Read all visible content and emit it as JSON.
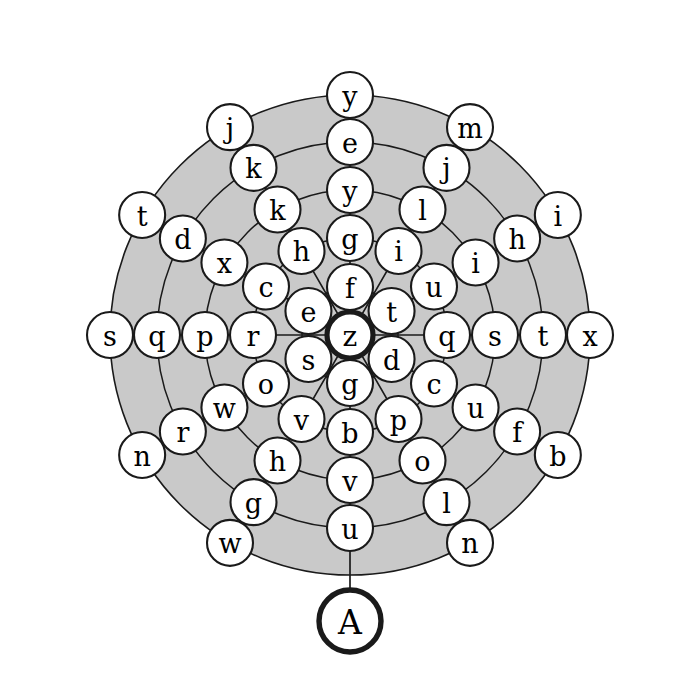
{
  "figure": {
    "name": "radial-letter-tree",
    "background_color": "#ffffff",
    "ring_fill_color": "#c9c9c9",
    "node_fill_color": "#ffffff",
    "stroke_color": "#1a1a1a"
  },
  "geometry": {
    "center_x": 350,
    "center_y": 335,
    "ring_radii": [
      48,
      97,
      145,
      193,
      240
    ],
    "node_radius": 23,
    "goal_node_radius": 31,
    "spoke_count": 12,
    "spoke_step_degrees": 30,
    "goal_radius": 286
  },
  "chart_data": {
    "type": "tree",
    "title": "",
    "root": {
      "label": "z",
      "emphasis": "bold"
    },
    "goal": {
      "label": "A",
      "emphasis": "bold",
      "angle_degrees": 90
    },
    "spokes": [
      {
        "angle_degrees": 270,
        "direction": "north",
        "labels": [
          "f",
          "g",
          "y",
          "e",
          "y"
        ]
      },
      {
        "angle_degrees": 300,
        "direction": "north-northeast",
        "labels": [
          "i",
          "l",
          "j",
          "m"
        ]
      },
      {
        "angle_degrees": 330,
        "direction": "northeast",
        "labels": [
          "t",
          "u",
          "i",
          "h",
          "i"
        ]
      },
      {
        "angle_degrees": 0,
        "direction": "east",
        "labels": [
          "q",
          "s",
          "t",
          "x"
        ]
      },
      {
        "angle_degrees": 30,
        "direction": "southeast",
        "labels": [
          "d",
          "c",
          "u",
          "f",
          "b"
        ]
      },
      {
        "angle_degrees": 60,
        "direction": "south-southeast",
        "labels": [
          "p",
          "o",
          "l",
          "n"
        ]
      },
      {
        "angle_degrees": 90,
        "direction": "south",
        "labels": [
          "g",
          "b",
          "v",
          "u"
        ]
      },
      {
        "angle_degrees": 120,
        "direction": "south-southwest",
        "labels": [
          "v",
          "h",
          "g",
          "w"
        ]
      },
      {
        "angle_degrees": 150,
        "direction": "southwest",
        "labels": [
          "s",
          "o",
          "w",
          "r",
          "n"
        ]
      },
      {
        "angle_degrees": 180,
        "direction": "west",
        "labels": [
          "r",
          "p",
          "q",
          "s"
        ]
      },
      {
        "angle_degrees": 210,
        "direction": "northwest",
        "labels": [
          "e",
          "c",
          "x",
          "d",
          "t"
        ]
      },
      {
        "angle_degrees": 240,
        "direction": "north-northwest",
        "labels": [
          "h",
          "k",
          "k",
          "j"
        ]
      }
    ],
    "nodes": [
      {
        "label": "z",
        "ring": 0,
        "angle": 0,
        "kind": "root"
      },
      {
        "label": "f",
        "ring": 1,
        "angle": 270
      },
      {
        "label": "t",
        "ring": 1,
        "angle": 330
      },
      {
        "label": "d",
        "ring": 1,
        "angle": 30
      },
      {
        "label": "g",
        "ring": 1,
        "angle": 90
      },
      {
        "label": "s",
        "ring": 1,
        "angle": 150
      },
      {
        "label": "e",
        "ring": 1,
        "angle": 210
      },
      {
        "label": "g",
        "ring": 2,
        "angle": 270
      },
      {
        "label": "i",
        "ring": 2,
        "angle": 300
      },
      {
        "label": "u",
        "ring": 2,
        "angle": 330
      },
      {
        "label": "q",
        "ring": 2,
        "angle": 0
      },
      {
        "label": "c",
        "ring": 2,
        "angle": 30
      },
      {
        "label": "p",
        "ring": 2,
        "angle": 60
      },
      {
        "label": "b",
        "ring": 2,
        "angle": 90
      },
      {
        "label": "v",
        "ring": 2,
        "angle": 120
      },
      {
        "label": "o",
        "ring": 2,
        "angle": 150
      },
      {
        "label": "r",
        "ring": 2,
        "angle": 180
      },
      {
        "label": "c",
        "ring": 2,
        "angle": 210
      },
      {
        "label": "h",
        "ring": 2,
        "angle": 240
      },
      {
        "label": "y",
        "ring": 3,
        "angle": 270
      },
      {
        "label": "l",
        "ring": 3,
        "angle": 300
      },
      {
        "label": "i",
        "ring": 3,
        "angle": 330
      },
      {
        "label": "s",
        "ring": 3,
        "angle": 0
      },
      {
        "label": "u",
        "ring": 3,
        "angle": 30
      },
      {
        "label": "o",
        "ring": 3,
        "angle": 60
      },
      {
        "label": "v",
        "ring": 3,
        "angle": 90
      },
      {
        "label": "h",
        "ring": 3,
        "angle": 120
      },
      {
        "label": "w",
        "ring": 3,
        "angle": 150
      },
      {
        "label": "p",
        "ring": 3,
        "angle": 180
      },
      {
        "label": "x",
        "ring": 3,
        "angle": 210
      },
      {
        "label": "k",
        "ring": 3,
        "angle": 240
      },
      {
        "label": "e",
        "ring": 4,
        "angle": 270
      },
      {
        "label": "j",
        "ring": 4,
        "angle": 300
      },
      {
        "label": "h",
        "ring": 4,
        "angle": 330
      },
      {
        "label": "t",
        "ring": 4,
        "angle": 0
      },
      {
        "label": "f",
        "ring": 4,
        "angle": 30
      },
      {
        "label": "l",
        "ring": 4,
        "angle": 60
      },
      {
        "label": "u",
        "ring": 4,
        "angle": 90
      },
      {
        "label": "g",
        "ring": 4,
        "angle": 120
      },
      {
        "label": "r",
        "ring": 4,
        "angle": 150
      },
      {
        "label": "q",
        "ring": 4,
        "angle": 180
      },
      {
        "label": "d",
        "ring": 4,
        "angle": 210
      },
      {
        "label": "k",
        "ring": 4,
        "angle": 240
      },
      {
        "label": "y",
        "ring": 5,
        "angle": 270
      },
      {
        "label": "m",
        "ring": 5,
        "angle": 300
      },
      {
        "label": "i",
        "ring": 5,
        "angle": 330
      },
      {
        "label": "x",
        "ring": 5,
        "angle": 0
      },
      {
        "label": "b",
        "ring": 5,
        "angle": 30
      },
      {
        "label": "n",
        "ring": 5,
        "angle": 60
      },
      {
        "label": "A",
        "ring": 6,
        "angle": 90,
        "kind": "goal"
      },
      {
        "label": "w",
        "ring": 5,
        "angle": 120
      },
      {
        "label": "n",
        "ring": 5,
        "angle": 150
      },
      {
        "label": "s",
        "ring": 5,
        "angle": 180
      },
      {
        "label": "t",
        "ring": 5,
        "angle": 210
      },
      {
        "label": "j",
        "ring": 5,
        "angle": 240
      }
    ]
  }
}
